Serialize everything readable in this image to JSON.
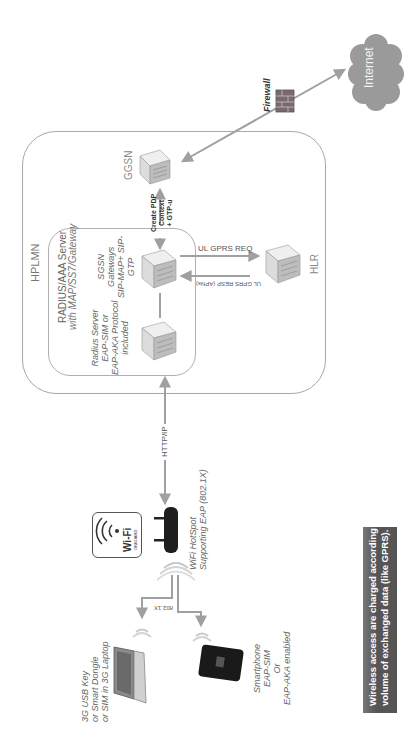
{
  "diagram": {
    "orientation": "rotated -90deg (text reads bottom-to-top)",
    "zones": {
      "hplmn": "HPLMN",
      "radius_group": [
        "RADIUS/AAA Server",
        "with MAP/SS7/Gateway"
      ]
    },
    "nodes": {
      "internet": "Internet",
      "firewall": "Firewall",
      "ggsn": "GGSN",
      "hlr": "HLR",
      "sgsn": [
        "SGSN",
        "Gateways",
        "SIP-MAP+ SIP-",
        "GTP"
      ],
      "radius_server": [
        "Radius Server",
        "EAP-SIM or",
        "EAP-AKA Protocol",
        "included"
      ],
      "wifi_hotspot": [
        "WiFi HotSpot",
        "Supporting EAP (802.1X)"
      ],
      "wifi_logo": {
        "main": "Wi-Fi",
        "sub": "ONBOARD"
      },
      "laptop": [
        "3G USB Key",
        "or Smart Dongle",
        "or SIM in 3G Laptop"
      ],
      "smartphone": [
        "Smartphone",
        "EAP-SIM",
        "Or",
        "EAP-AKA enabled"
      ]
    },
    "edges": {
      "create_pdp": [
        "Create PDP",
        "Context",
        "+ GTP-u"
      ],
      "ul_gprs_req": "UL GPRS REQ",
      "ul_gprs_resp": "UL GPRS RESP (APNs)",
      "http_ip": "HTTP/IP",
      "dot1x": "802.1X"
    },
    "note": [
      "Wireless access are charged according to the",
      "volume of exchanged data (like GPRS)."
    ],
    "colors": {
      "line": "#a0a0a0",
      "cloud": "#9a9a9a",
      "note_bg": "#5a5a5a",
      "note_text": "#ffffff"
    }
  }
}
